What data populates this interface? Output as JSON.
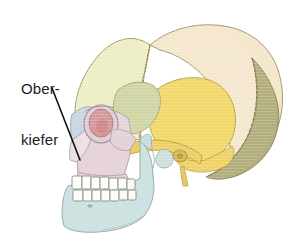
{
  "figure": {
    "background_color": "#ffffff",
    "width": 292,
    "height": 245
  },
  "labels": [
    {
      "name": "maxilla-label",
      "line1": "Ober-",
      "line2": "kiefer",
      "text_color": "#1d1d1d",
      "leader_line": {
        "from_x": 52,
        "from_y": 88,
        "to_x": 80,
        "to_y": 160,
        "color": "#111111"
      }
    }
  ],
  "bones": [
    {
      "name": "frontal-bone",
      "label": "Stirnbein",
      "color": "#eeeec4"
    },
    {
      "name": "parietal-bone",
      "label": "Scheitelbein",
      "color": "#f4e7cd"
    },
    {
      "name": "occipital-bone",
      "label": "Hinterhauptbein",
      "color": "#b3ae7e"
    },
    {
      "name": "temporal-bone",
      "label": "Schlaefenbein",
      "color": "#f2d86a"
    },
    {
      "name": "sphenoid-bone",
      "label": "Keilbein",
      "color": "#cfd5a4"
    },
    {
      "name": "zygomatic-arch",
      "label": "Jochbogen",
      "color": "#edcf63"
    },
    {
      "name": "maxilla-bone",
      "label": "Oberkiefer",
      "color": "#e6d3dc"
    },
    {
      "name": "nasal-bone",
      "label": "Nasenbein",
      "color": "#c8d8e2"
    },
    {
      "name": "orbit-cavity",
      "label": "Augenhoehle",
      "color": "#d59a9c"
    },
    {
      "name": "mandible-bone",
      "label": "Unterkiefer",
      "color": "#cfe2e2"
    },
    {
      "name": "teeth",
      "label": "Zaehne",
      "color": "#fdfdfa"
    }
  ],
  "outline_color": "#8a8262"
}
